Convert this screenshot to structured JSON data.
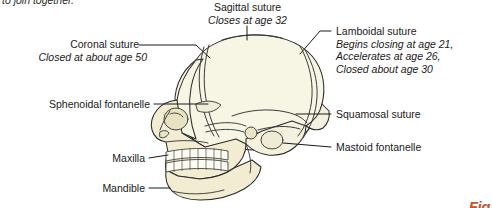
{
  "figure": {
    "title_fragment_clipped_top": "to join together.",
    "figure_mark_clipped_bottom": "Fig",
    "figure_mark_color": "#c8502a",
    "bone_fill_cranium": "#f7f6e4",
    "bone_fill_face": "#f2edd2",
    "outline_color": "#2b2b2b",
    "leader_color": "#1a1a1a",
    "background": "#ffffff"
  },
  "labels": {
    "coronal": {
      "term": "Coronal suture",
      "note": "Closed at about age 50"
    },
    "sagittal": {
      "term": "Sagittal suture",
      "note": "Closes at age 32"
    },
    "lamboidal": {
      "term": "Lamboidal suture",
      "note_line1": "Begins closing at age 21,",
      "note_line2": "Accelerates at age 26,",
      "note_line3": "Closed about age 30"
    },
    "sphenoidal": {
      "term": "Sphenoidal fontanelle"
    },
    "squamosal": {
      "term": "Squamosal suture"
    },
    "mastoid": {
      "term": "Mastoid fontanelle"
    },
    "maxilla": {
      "term": "Maxilla"
    },
    "mandible": {
      "term": "Mandible"
    }
  }
}
